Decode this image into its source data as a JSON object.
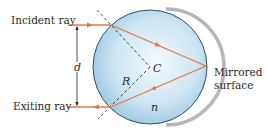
{
  "labels": {
    "incident_ray": "Incident ray",
    "exiting_ray": "Exiting ray",
    "mirrored_surface_line1": "Mirrored",
    "mirrored_surface_line2": "surface",
    "d": "d",
    "R": "R",
    "C": "C",
    "n": "n"
  },
  "colors": {
    "ray": "#e07a4a",
    "sphere_edge": "#2f4f68",
    "sphere_fill_light": "#f4fafd",
    "sphere_fill_dark": "#8fc0dc",
    "mirror": "#b5b5be",
    "dashed": "#333333",
    "dimension": "#222222"
  },
  "geometry": {
    "center": [
      150,
      67
    ],
    "radius": 57,
    "entry_point": [
      111,
      25
    ],
    "exit_point": [
      111,
      107
    ],
    "reflection_point": [
      206,
      66
    ]
  }
}
